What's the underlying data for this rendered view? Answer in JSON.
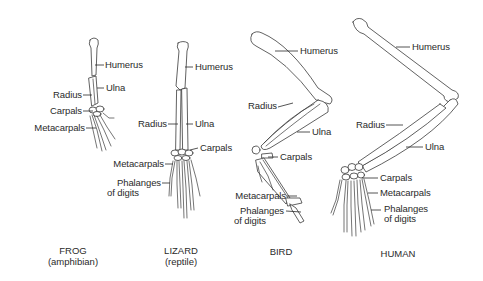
{
  "diagram": {
    "type": "homologous-forelimb-comparison",
    "colors": {
      "line": "#3a3a3a",
      "text": "#2a2a2a",
      "background": "#ffffff"
    },
    "animals": [
      {
        "name": "FROG",
        "subtitle": "(amphibian)",
        "labels": {
          "humerus": "Humerus",
          "ulna": "Ulna",
          "radius": "Radius",
          "carpals": "Carpals",
          "metacarpals": "Metacarpals"
        }
      },
      {
        "name": "LIZARD",
        "subtitle": "(reptile)",
        "labels": {
          "humerus": "Humerus",
          "radius": "Radius",
          "ulna": "Ulna",
          "carpals": "Carpals",
          "metacarpals": "Metacarpals",
          "phalanges_1": "Phalanges",
          "phalanges_2": "of digits"
        }
      },
      {
        "name": "BIRD",
        "subtitle": "",
        "labels": {
          "humerus": "Humerus",
          "radius": "Radius",
          "ulna": "Ulna",
          "carpals": "Carpals",
          "metacarpals": "Metacarpals",
          "phalanges_1": "Phalanges",
          "phalanges_2": "of digits"
        }
      },
      {
        "name": "HUMAN",
        "subtitle": "",
        "labels": {
          "humerus": "Humerus",
          "radius": "Radius",
          "ulna": "Ulna",
          "carpals": "Carpals",
          "metacarpals": "Metacarpals",
          "phalanges_1": "Phalanges",
          "phalanges_2": "of digits"
        }
      }
    ]
  }
}
